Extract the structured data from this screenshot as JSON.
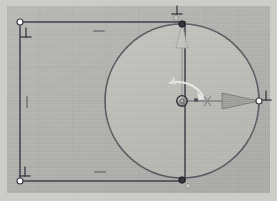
{
  "viewport": {
    "width": 277,
    "height": 201,
    "background_color": "#b2b2ae",
    "outer_frame_color": "#c9c9c4",
    "grid": {
      "visible": true,
      "spacing": 33,
      "color": "#a8a8a3"
    }
  },
  "sketch": {
    "title": "Sketch Viewport",
    "entities": {
      "rectangle": {
        "name": "rectangle-profile",
        "x": 20,
        "y": 22,
        "width": 165,
        "height": 159,
        "stroke_color": "#4a4a52",
        "stroke_width": 1.6
      },
      "circle": {
        "name": "circle-profile",
        "center_x": 182,
        "center_y": 101,
        "radius": 77,
        "stroke_color": "#5a5a62",
        "fill_color": "#bdbdb8",
        "stroke_width": 1.7
      }
    },
    "vertices": [
      {
        "name": "vertex-top-left",
        "x": 20,
        "y": 22,
        "style": "open",
        "fill": "#ffffff",
        "stroke": "#3c3c44",
        "r": 3.0
      },
      {
        "name": "vertex-bottom-left",
        "x": 20,
        "y": 181,
        "style": "open",
        "fill": "#ffffff",
        "stroke": "#3c3c44",
        "r": 3.0
      },
      {
        "name": "vertex-top-circle",
        "x": 182,
        "y": 24,
        "style": "filled",
        "fill": "#34343c",
        "stroke": "#1e1e24",
        "r": 3.2
      },
      {
        "name": "vertex-bottom-circle",
        "x": 182,
        "y": 180,
        "style": "filled",
        "fill": "#34343c",
        "stroke": "#1e1e24",
        "r": 3.2
      },
      {
        "name": "vertex-right-circle",
        "x": 259,
        "y": 101,
        "style": "open",
        "fill": "#ffffff",
        "stroke": "#3c3c44",
        "r": 3.0
      },
      {
        "name": "vertex-bottom-ghost",
        "x": 188,
        "y": 186,
        "style": "ghost",
        "fill": "#cfcfca",
        "stroke": "#8d8d88",
        "r": 2.4
      },
      {
        "name": "vertex-top-ghost",
        "x": 176,
        "y": 18,
        "style": "ghost",
        "fill": "#cfcfca",
        "stroke": "#8d8d88",
        "r": 2.4
      }
    ],
    "constraints": [
      {
        "name": "constraint-perpendicular-top-left",
        "symbol": "perpendicular",
        "glyph": "⊥",
        "x": 26,
        "y": 33,
        "rotation": 0
      },
      {
        "name": "constraint-perpendicular-bottom-left",
        "symbol": "perpendicular",
        "glyph": "⊥",
        "x": 25,
        "y": 172,
        "rotation": 0
      },
      {
        "name": "constraint-perpendicular-top-center",
        "symbol": "perpendicular",
        "glyph": "⊥",
        "x": 176,
        "y": 10,
        "rotation": 0
      },
      {
        "name": "constraint-perpendicular-right",
        "symbol": "perpendicular",
        "glyph": "⊥",
        "x": 266,
        "y": 96,
        "rotation": 0
      },
      {
        "name": "constraint-horizontal-top",
        "symbol": "horizontal",
        "glyph": "—",
        "x": 99,
        "y": 31,
        "rotation": 0
      },
      {
        "name": "constraint-horizontal-bottom",
        "symbol": "horizontal",
        "glyph": "—",
        "x": 100,
        "y": 172,
        "rotation": 0
      },
      {
        "name": "constraint-vertical-left",
        "symbol": "vertical",
        "glyph": "—",
        "x": 27,
        "y": 102,
        "rotation": 90
      }
    ],
    "manipulator": {
      "name": "transform-gizmo",
      "origin_x": 182,
      "origin_y": 101,
      "handle_radius": 5.2,
      "handle_fill": "#9a9a95",
      "handle_stroke": "#2e2e36",
      "axes": [
        {
          "name": "gizmo-axis-x",
          "label": "X",
          "direction": "right",
          "tip_x": 258,
          "tip_y": 101,
          "color": "#62626a",
          "arrow_fill": "#9b9b96",
          "label_x": 207,
          "label_y": 104
        },
        {
          "name": "gizmo-axis-y",
          "label": "Y",
          "direction": "up",
          "tip_x": 182,
          "tip_y": 25,
          "color": "#8c8c94",
          "arrow_fill": "#c0c0bb",
          "label_x": 0,
          "label_y": 0
        }
      ],
      "rotation_arc": {
        "name": "gizmo-rotation-arc",
        "color": "#e6e6e1",
        "start_x": 172,
        "start_y": 80,
        "end_x": 203,
        "end_y": 96,
        "radius": 28,
        "arrow_head": true
      },
      "drag_dot": {
        "name": "gizmo-drag-dot",
        "x": 196,
        "y": 100,
        "r": 2.0,
        "fill": "#4e4e56"
      }
    }
  }
}
